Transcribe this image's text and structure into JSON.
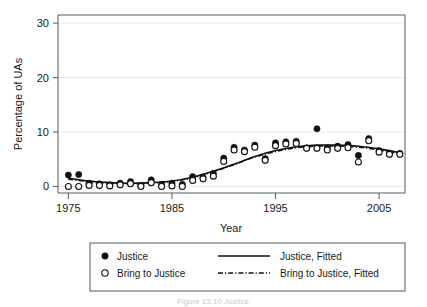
{
  "figure": {
    "caption": "Figure 13.10   Justice"
  },
  "axes": {
    "y_title": "Percentage of UAs",
    "x_title": "Year",
    "y_ticks": [
      0,
      10,
      20,
      30
    ],
    "x_ticks": [
      1975,
      1985,
      1995,
      2005
    ],
    "y_tick_labels": [
      "0",
      "10",
      "20",
      "30"
    ],
    "x_tick_labels": [
      "1975",
      "1985",
      "1995",
      "2005"
    ]
  },
  "legend": {
    "entries": [
      {
        "label": "Justice",
        "marker": "filled-circle-icon"
      },
      {
        "label": "Bring to Justice",
        "marker": "open-circle-icon"
      },
      {
        "label": "Justice, Fitted",
        "marker": "solid-line-icon"
      },
      {
        "label": "Bring to Justice, Fitted",
        "marker": "dash-dot-line-icon"
      }
    ]
  },
  "colors": {
    "ink": "#111111",
    "frame": "#555a5e",
    "grid": "#ececed",
    "background": "#ffffff"
  },
  "chart_data": {
    "type": "scatter",
    "title": "",
    "subtitle": "",
    "xlabel": "Year",
    "ylabel": "Percentage of UAs",
    "xlim": [
      1974,
      2007.5
    ],
    "ylim": [
      -1.2,
      31.5
    ],
    "grid": true,
    "legend_position": "below-plot",
    "series": [
      {
        "name": "Justice",
        "marker": "filled-circle",
        "x": [
          1975,
          1976,
          1977,
          1978,
          1979,
          1980,
          1981,
          1982,
          1983,
          1984,
          1985,
          1986,
          1987,
          1988,
          1989,
          1990,
          1991,
          1992,
          1993,
          1994,
          1995,
          1996,
          1997,
          1998,
          1999,
          2000,
          2001,
          2002,
          2003,
          2004,
          2005,
          2006,
          2007
        ],
        "y": [
          2.1,
          2.2,
          0.6,
          0.5,
          0.3,
          0.6,
          0.9,
          0.2,
          1.2,
          0.4,
          0.6,
          0.4,
          1.8,
          1.7,
          2.4,
          5.2,
          7.2,
          6.7,
          7.6,
          5.1,
          8.0,
          8.2,
          8.3,
          7.1,
          10.6,
          7.1,
          7.4,
          7.7,
          5.7,
          8.8,
          6.6,
          6.1,
          6.1
        ]
      },
      {
        "name": "Bring to Justice",
        "marker": "open-circle",
        "x": [
          1975,
          1976,
          1977,
          1978,
          1979,
          1980,
          1981,
          1982,
          1983,
          1984,
          1985,
          1986,
          1987,
          1988,
          1989,
          1990,
          1991,
          1992,
          1993,
          1994,
          1995,
          1996,
          1997,
          1998,
          1999,
          2000,
          2001,
          2002,
          2003,
          2004,
          2005,
          2006,
          2007
        ],
        "y": [
          0.0,
          0.0,
          0.2,
          0.2,
          0.1,
          0.3,
          0.5,
          0.0,
          0.7,
          0.0,
          0.1,
          0.0,
          1.1,
          1.4,
          1.9,
          4.6,
          6.7,
          6.4,
          7.2,
          4.8,
          7.5,
          7.8,
          7.9,
          7.0,
          7.0,
          6.7,
          7.0,
          7.1,
          4.5,
          8.4,
          6.3,
          5.9,
          5.9
        ]
      }
    ],
    "fits": [
      {
        "name": "Justice, Fitted",
        "style": "solid",
        "x": [
          1975,
          1977,
          1979,
          1981,
          1983,
          1985,
          1987,
          1989,
          1991,
          1993,
          1995,
          1997,
          1999,
          2001,
          2003,
          2005,
          2007
        ],
        "y": [
          1.5,
          1.0,
          0.7,
          0.6,
          0.7,
          1.0,
          1.7,
          2.8,
          4.1,
          5.5,
          6.6,
          7.3,
          7.6,
          7.6,
          7.4,
          6.9,
          6.2
        ]
      },
      {
        "name": "Bring to Justice, Fitted",
        "style": "dash-dot",
        "x": [
          1975,
          1977,
          1979,
          1981,
          1983,
          1985,
          1987,
          1989,
          1991,
          1993,
          1995,
          1997,
          1999,
          2001,
          2003,
          2005,
          2007
        ],
        "y": [
          1.3,
          0.9,
          0.6,
          0.5,
          0.6,
          0.9,
          1.6,
          2.7,
          4.0,
          5.4,
          6.4,
          7.1,
          7.4,
          7.4,
          7.2,
          6.7,
          6.0
        ]
      }
    ]
  }
}
